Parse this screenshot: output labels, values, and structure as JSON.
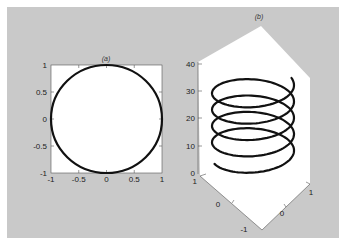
{
  "figure": {
    "background": "#c9c9c9",
    "axes_background": "#ffffff",
    "line_color": "#111111"
  },
  "chart_data": [
    {
      "type": "line",
      "title": "(a)",
      "description": "Unit circle x = cos(t), y = sin(t)",
      "xlabel": "",
      "ylabel": "",
      "xlim": [
        -1,
        1
      ],
      "ylim": [
        -1,
        1
      ],
      "xticks": [
        "-1",
        "-0.5",
        "0",
        "0.5",
        "1"
      ],
      "yticks": [
        "-1",
        "-0.5",
        "0",
        "0.5",
        "1"
      ],
      "grid": false,
      "series": [
        {
          "name": "circle",
          "x": [
            1,
            0.707,
            0,
            -0.707,
            -1,
            -0.707,
            0,
            0.707,
            1
          ],
          "y": [
            0,
            0.707,
            1,
            0.707,
            0,
            -0.707,
            -1,
            -0.707,
            0
          ]
        }
      ]
    },
    {
      "type": "line3d",
      "title": "(b)",
      "description": "Helix x = cos(t), y = sin(t), z = t, about 5 turns from z=10 to z=37",
      "xlim": [
        -1,
        1
      ],
      "ylim": [
        -1,
        1
      ],
      "zlim": [
        0,
        40
      ],
      "xticks": [
        "-1",
        "0",
        "1"
      ],
      "yticks": [
        "1",
        "0",
        "-1"
      ],
      "zticks": [
        "0",
        "10",
        "20",
        "30",
        "40"
      ],
      "grid": false,
      "series": [
        {
          "name": "helix",
          "z_start": 10,
          "z_end": 37,
          "turns": 4.5
        }
      ]
    }
  ],
  "labels": {
    "a_title": "(a)",
    "b_title": "(b)",
    "a_x": [
      "-1",
      "-0.5",
      "0",
      "0.5",
      "1"
    ],
    "a_y": [
      "1",
      "0.5",
      "0",
      "-0.5",
      "-1"
    ],
    "b_z": [
      "40",
      "30",
      "20",
      "10",
      "0"
    ],
    "b_y": [
      "1",
      "0",
      "-1"
    ],
    "b_x": [
      "0",
      "1"
    ]
  }
}
